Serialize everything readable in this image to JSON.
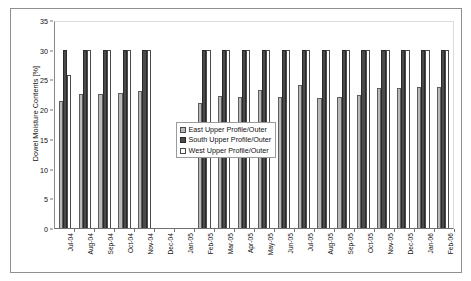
{
  "chart_data": {
    "type": "bar",
    "title": "",
    "xlabel": "",
    "ylabel": "Dowel Moisture Contents [%]",
    "ylim": [
      0,
      35
    ],
    "yticks": [
      0,
      5,
      10,
      15,
      20,
      25,
      30,
      35
    ],
    "grid": false,
    "legend_position": "inside-center-left",
    "categories": [
      "Jul-04",
      "Aug-04",
      "Sep-04",
      "Oct-04",
      "Nov-04",
      "Dec-04",
      "Jan-05",
      "Feb-05",
      "Mar-05",
      "Apr-05",
      "May-05",
      "Jun-05",
      "Jul-05",
      "Aug-05",
      "Sep-05",
      "Oct-05",
      "Nov-05",
      "Dec-05",
      "Jan-06",
      "Feb-06"
    ],
    "series": [
      {
        "name": "East Upper Profile/Outer",
        "color": "#b9b9b9",
        "values": [
          21.3,
          22.5,
          22.5,
          22.8,
          23.0,
          null,
          null,
          21.0,
          22.2,
          22.0,
          23.3,
          22.0,
          24.0,
          21.8,
          22.0,
          22.3,
          23.5,
          23.6,
          23.7,
          23.8
        ]
      },
      {
        "name": "South Upper Profile/Outer",
        "color": "#4a4a4a",
        "values": [
          30.0,
          30.0,
          30.0,
          30.0,
          30.0,
          null,
          null,
          30.0,
          30.0,
          30.0,
          30.0,
          30.0,
          30.0,
          30.0,
          30.0,
          30.0,
          30.0,
          30.0,
          30.0,
          30.0
        ]
      },
      {
        "name": "West Upper Profile/Outer",
        "color": "#ffffff",
        "values": [
          25.7,
          30.0,
          30.0,
          30.0,
          30.0,
          null,
          null,
          30.0,
          30.0,
          30.0,
          30.0,
          30.0,
          30.0,
          30.0,
          30.0,
          30.0,
          30.0,
          30.0,
          30.0,
          30.0
        ]
      }
    ]
  },
  "axis": {
    "y_title": "Dowel Moisture Contents [%]"
  },
  "legend": {
    "entries": [
      {
        "label": "East Upper Profile/Outer"
      },
      {
        "label": "South Upper Profile/Outer"
      },
      {
        "label": "West Upper Profile/Outer"
      }
    ]
  }
}
